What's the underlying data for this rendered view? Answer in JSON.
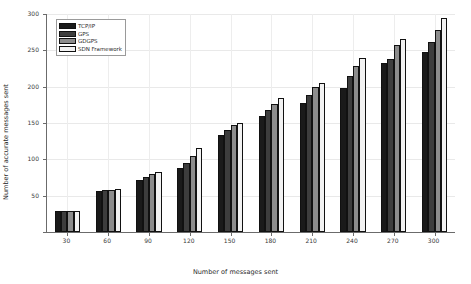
{
  "chart_data": {
    "type": "bar",
    "title": "",
    "xlabel": "Number of messages sent",
    "ylabel": "Number of accurate messages sent",
    "categories": [
      "30",
      "60",
      "90",
      "120",
      "150",
      "180",
      "210",
      "240",
      "270",
      "300"
    ],
    "series": [
      {
        "name": "TCP/IP",
        "color": "#1a1a1a",
        "values": [
          29,
          57,
          72,
          88,
          134,
          160,
          178,
          198,
          233,
          248
        ]
      },
      {
        "name": "GPS",
        "color": "#3d3d3d",
        "values": [
          29,
          58,
          76,
          95,
          140,
          168,
          188,
          215,
          238,
          262
        ]
      },
      {
        "name": "GDGPS",
        "color": "#8c8c8c",
        "values": [
          29,
          58,
          80,
          104,
          147,
          176,
          199,
          228,
          258,
          278
        ]
      },
      {
        "name": "SDN Framework",
        "color": "#f2f2f2",
        "values": [
          29,
          59,
          83,
          116,
          150,
          184,
          205,
          240,
          265,
          295
        ]
      }
    ],
    "ylim": [
      0,
      300
    ],
    "yticks": [
      0,
      50,
      100,
      150,
      200,
      250,
      300
    ],
    "ytick_labels": [
      "0",
      "50",
      "100",
      "150",
      "200",
      "250",
      "300"
    ],
    "grid": true,
    "legend_position": "upper-left",
    "axis_color": "#6b6b6b",
    "grid_color": "#e9e9e9",
    "background": "#ffffff"
  }
}
